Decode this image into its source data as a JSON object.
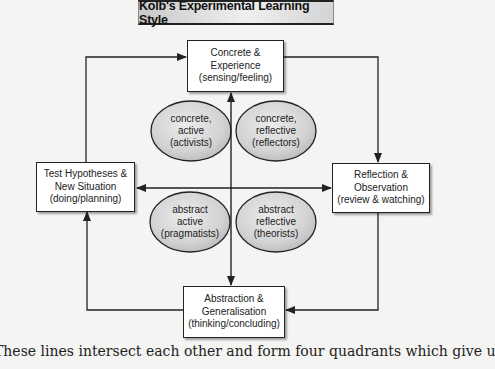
{
  "title": "Kolb's Experimental Learning Style",
  "boxes": {
    "top": {
      "line1": "Concrete &",
      "line2": "Experience",
      "line3": "(sensing/feeling)"
    },
    "right": {
      "line1": "Reflection &",
      "line2": "Observation",
      "line3": "(review & watching)"
    },
    "bottom": {
      "line1": "Abstraction &",
      "line2": "Generalisation",
      "line3": "(thinking/concluding)"
    },
    "left": {
      "line1": "Test Hypotheses &",
      "line2": "New Situation",
      "line3": "(doing/planning)"
    }
  },
  "quadrants": {
    "top_left": {
      "line1": "concrete,",
      "line2": "active",
      "line3": "(activists)"
    },
    "top_right": {
      "line1": "concrete,",
      "line2": "reflective",
      "line3": "(reflectors)"
    },
    "bottom_left": {
      "line1": "abstract",
      "line2": "active",
      "line3": "(pragmatists)"
    },
    "bottom_right": {
      "line1": "abstract",
      "line2": "reflective",
      "line3": "(theorists)"
    }
  },
  "caption": "These lines intersect each other and form four quadrants which give u",
  "colors": {
    "line": "#222222",
    "ellipse_fill": "#d6d6d6",
    "background": "#f4f4f2"
  }
}
